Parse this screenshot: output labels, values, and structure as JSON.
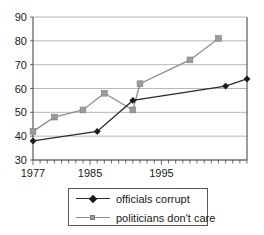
{
  "chart_data": {
    "type": "line",
    "title": "",
    "subtitle": "",
    "xlabel": "",
    "ylabel": "",
    "xlim": [
      1977,
      2007
    ],
    "ylim": [
      30,
      90
    ],
    "ytick_values": [
      90,
      80,
      70,
      60,
      50,
      40,
      30
    ],
    "ytick_labels": [
      "90",
      "80",
      "70",
      "60",
      "50",
      "40",
      "30"
    ],
    "xtick_values": [
      1977,
      1985,
      1995
    ],
    "xtick_labels": [
      "1977",
      "1985",
      "1995"
    ],
    "xtick_interval_years": 1,
    "grid": "horizontal",
    "legend_position": "bottom-center",
    "series": [
      {
        "name": "officials corrupt",
        "color": "#2b2b2b",
        "marker": "diamond",
        "points": [
          {
            "x": 1977,
            "y": 38
          },
          {
            "x": 1986,
            "y": 42
          },
          {
            "x": 1991,
            "y": 55
          },
          {
            "x": 2004,
            "y": 61
          },
          {
            "x": 2007,
            "y": 64
          }
        ]
      },
      {
        "name": "politicians don't care",
        "color": "#9b9b9b",
        "marker": "square",
        "points": [
          {
            "x": 1977,
            "y": 42
          },
          {
            "x": 1980,
            "y": 48
          },
          {
            "x": 1984,
            "y": 51
          },
          {
            "x": 1987,
            "y": 58
          },
          {
            "x": 1991,
            "y": 51
          },
          {
            "x": 1992,
            "y": 62
          },
          {
            "x": 1999,
            "y": 72
          },
          {
            "x": 2003,
            "y": 81
          }
        ]
      }
    ]
  },
  "legend": {
    "entries": [
      {
        "label": "officials corrupt",
        "marker": "diamond-icon",
        "color": "#2b2b2b"
      },
      {
        "label": "politicians don't care",
        "marker": "square-icon",
        "color": "#9b9b9b"
      }
    ]
  }
}
